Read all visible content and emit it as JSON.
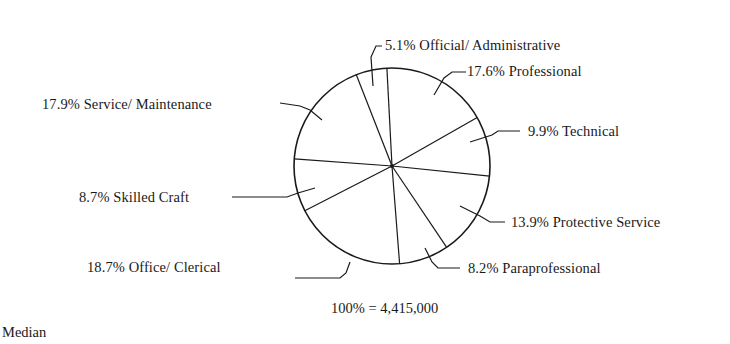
{
  "chart_data": {
    "type": "pie",
    "title": "",
    "total_label": "100% = 4,415,000",
    "total": 4415000,
    "slices": [
      {
        "label": "Professional",
        "percent": 17.6,
        "display": "17.6% Professional"
      },
      {
        "label": "Technical",
        "percent": 9.9,
        "display": "9.9% Technical"
      },
      {
        "label": "Protective Service",
        "percent": 13.9,
        "display": "13.9% Protective Service"
      },
      {
        "label": "Paraprofessional",
        "percent": 8.2,
        "display": "8.2% Paraprofessional"
      },
      {
        "label": "Office/Clerical",
        "percent": 18.7,
        "display": "18.7% Office/Clerical"
      },
      {
        "label": "Skilled Craft",
        "percent": 8.7,
        "display": "8.7% Skilled Craft"
      },
      {
        "label": "Service/Maintenance",
        "percent": 17.9,
        "display": "17.9% Service/ Maintenance"
      },
      {
        "label": "Official/Administrative",
        "percent": 5.1,
        "display": "5.1% Official/ Administrative"
      }
    ],
    "legend": "none (leader-line labels)",
    "start_angle_deg_from_top": -3,
    "direction": "clockwise"
  },
  "labels": {
    "official": "5.1% Official/ Administrative",
    "professional": "17.6% Professional",
    "technical": "9.9% Technical",
    "protective": "13.9% Protective Service",
    "paraprofessional": "8.2% Paraprofessional",
    "office": "18.7% Office/ Clerical",
    "skilled": "8.7% Skilled Craft",
    "service": "17.9% Service/ Maintenance"
  },
  "total_text": "100% = 4,415,000",
  "footer_text": "Median"
}
